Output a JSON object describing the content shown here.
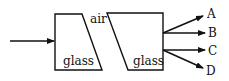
{
  "diagram": {
    "labels": {
      "left_block": "glass",
      "gap": "air",
      "right_block": "glass",
      "ray_a": "A",
      "ray_b": "B",
      "ray_c": "C",
      "ray_d": "D"
    },
    "colors": {
      "stroke": "#111111",
      "background": "#ffffff"
    }
  }
}
